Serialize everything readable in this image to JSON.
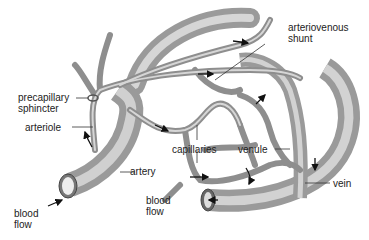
{
  "diagram": {
    "labels": {
      "arteriovenous_shunt": [
        "arteriovenous",
        "shunt"
      ],
      "precapillary_sphincter": [
        "precapillary",
        "sphincter"
      ],
      "arteriole": "arteriole",
      "capillaries": "capillaries",
      "venule": "venule",
      "artery": "artery",
      "vein": "vein",
      "blood_flow_left": [
        "blood",
        "flow"
      ],
      "blood_flow_center": [
        "blood",
        "flow"
      ]
    },
    "colors": {
      "vessel_fill": "#b8b8b8",
      "vessel_dark": "#7a7a7a",
      "vessel_light": "#dcdcdc",
      "line": "#333333",
      "text": "#222222"
    }
  }
}
